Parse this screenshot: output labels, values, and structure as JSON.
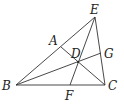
{
  "diagram": {
    "type": "geometry-triangle-cevians",
    "points": {
      "B": {
        "label": "B",
        "x": 16,
        "y": 85,
        "lx": 2,
        "ly": 90
      },
      "C": {
        "label": "C",
        "x": 105,
        "y": 85,
        "lx": 108,
        "ly": 90
      },
      "E": {
        "label": "E",
        "x": 95,
        "y": 17,
        "lx": 90,
        "ly": 14
      },
      "A": {
        "label": "A",
        "x": 61,
        "y": 47,
        "lx": 49,
        "ly": 45
      },
      "F": {
        "label": "F",
        "x": 70,
        "y": 85,
        "lx": 65,
        "ly": 100
      },
      "G": {
        "label": "G",
        "x": 101,
        "y": 53,
        "lx": 104,
        "ly": 58
      },
      "D": {
        "label": "D",
        "x": 78,
        "y": 62,
        "lx": 71,
        "ly": 58
      }
    },
    "segments": [
      [
        "B",
        "E"
      ],
      [
        "B",
        "C"
      ],
      [
        "E",
        "C"
      ],
      [
        "A",
        "C"
      ],
      [
        "E",
        "F"
      ],
      [
        "B",
        "G"
      ]
    ]
  }
}
